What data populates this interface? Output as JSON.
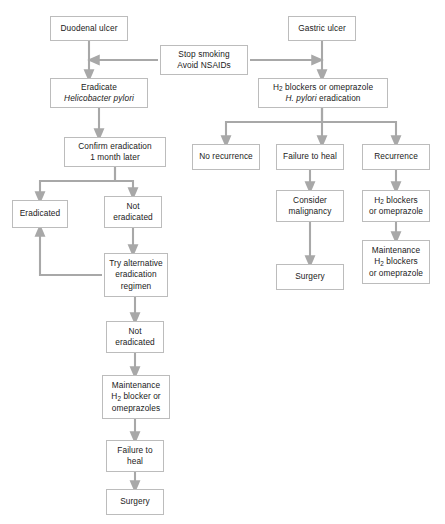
{
  "diagram": {
    "colors": {
      "box_border": "#bcbcbc",
      "box_fill": "#ffffff",
      "arrow": "#a8a8a8",
      "text": "#1a1a1a",
      "background": "#ffffff"
    },
    "nodes": [
      {
        "id": "duodenal_ulcer",
        "label": "Duodenal ulcer",
        "x": 50,
        "y": 16,
        "w": 78,
        "h": 25
      },
      {
        "id": "gastric_ulcer",
        "label": "Gastric ulcer",
        "x": 288,
        "y": 16,
        "w": 68,
        "h": 25
      },
      {
        "id": "stop_smoking",
        "label": "Stop smoking\nAvoid NSAIDs",
        "x": 160,
        "y": 45,
        "w": 88,
        "h": 30
      },
      {
        "id": "eradicate_hp",
        "label": "Eradicate\nHelicobacter pylori",
        "x": 50,
        "y": 78,
        "w": 98,
        "h": 30
      },
      {
        "id": "h2_blockers_top",
        "label": "H2 blockers or omeprazole\nH. pylori eradication",
        "x": 258,
        "y": 78,
        "w": 130,
        "h": 30
      },
      {
        "id": "confirm_eradication",
        "label": "Confirm eradication\n1 month later",
        "x": 64,
        "y": 137,
        "w": 102,
        "h": 30
      },
      {
        "id": "no_recurrence",
        "label": "No recurrence",
        "x": 192,
        "y": 144,
        "w": 68,
        "h": 26
      },
      {
        "id": "failure_to_heal_r",
        "label": "Failure to heal",
        "x": 276,
        "y": 144,
        "w": 68,
        "h": 26
      },
      {
        "id": "recurrence",
        "label": "Recurrence",
        "x": 362,
        "y": 144,
        "w": 68,
        "h": 26
      },
      {
        "id": "eradicated",
        "label": "Eradicated",
        "x": 12,
        "y": 200,
        "w": 56,
        "h": 28
      },
      {
        "id": "not_eradicated_1",
        "label": "Not\neradicated",
        "x": 104,
        "y": 196,
        "w": 58,
        "h": 32
      },
      {
        "id": "consider_malignancy",
        "label": "Consider\nmalignancy",
        "x": 276,
        "y": 190,
        "w": 68,
        "h": 32
      },
      {
        "id": "h2_blockers_mid",
        "label": "H2 blockers\nor omeprazole",
        "x": 362,
        "y": 190,
        "w": 68,
        "h": 32
      },
      {
        "id": "try_alternative",
        "label": "Try alternative\neradication\nregimen",
        "x": 104,
        "y": 253,
        "w": 64,
        "h": 44
      },
      {
        "id": "maintenance_right",
        "label": "Maintenance\nH2 blockers\nor omeprazole",
        "x": 362,
        "y": 240,
        "w": 68,
        "h": 44
      },
      {
        "id": "surgery_mid",
        "label": "Surgery",
        "x": 276,
        "y": 264,
        "w": 68,
        "h": 26
      },
      {
        "id": "not_eradicated_2",
        "label": "Not\neradicated",
        "x": 106,
        "y": 321,
        "w": 58,
        "h": 32
      },
      {
        "id": "maintenance_left",
        "label": "Maintenance\nH2 blocker or\nomeprazoles",
        "x": 102,
        "y": 375,
        "w": 68,
        "h": 44
      },
      {
        "id": "failure_to_heal_l",
        "label": "Failure to\nheal",
        "x": 106,
        "y": 440,
        "w": 58,
        "h": 32
      },
      {
        "id": "surgery_left",
        "label": "Surgery",
        "x": 106,
        "y": 489,
        "w": 58,
        "h": 26
      }
    ],
    "edges": [
      {
        "from": "duodenal_ulcer",
        "to": "eradicate_hp",
        "kind": "vertical"
      },
      {
        "from": "gastric_ulcer",
        "to": "h2_blockers_top",
        "kind": "vertical"
      },
      {
        "from": "stop_smoking",
        "to": "duodenal_ulcer_stem",
        "kind": "horizontal-left"
      },
      {
        "from": "stop_smoking",
        "to": "gastric_ulcer_stem",
        "kind": "horizontal-right"
      },
      {
        "from": "eradicate_hp",
        "to": "confirm_eradication",
        "kind": "vertical"
      },
      {
        "from": "confirm_eradication",
        "to": "eradicated",
        "kind": "branch-left"
      },
      {
        "from": "confirm_eradication",
        "to": "not_eradicated_1",
        "kind": "branch-right"
      },
      {
        "from": "not_eradicated_1",
        "to": "try_alternative",
        "kind": "vertical"
      },
      {
        "from": "try_alternative",
        "to": "eradicated",
        "kind": "loop-back-left"
      },
      {
        "from": "try_alternative",
        "to": "not_eradicated_2",
        "kind": "vertical"
      },
      {
        "from": "not_eradicated_2",
        "to": "maintenance_left",
        "kind": "vertical"
      },
      {
        "from": "maintenance_left",
        "to": "failure_to_heal_l",
        "kind": "vertical"
      },
      {
        "from": "failure_to_heal_l",
        "to": "surgery_left",
        "kind": "vertical"
      },
      {
        "from": "h2_blockers_top",
        "to": "no_recurrence",
        "kind": "branch-left"
      },
      {
        "from": "h2_blockers_top",
        "to": "failure_to_heal_r",
        "kind": "branch-center"
      },
      {
        "from": "h2_blockers_top",
        "to": "recurrence",
        "kind": "branch-right"
      },
      {
        "from": "failure_to_heal_r",
        "to": "consider_malignancy",
        "kind": "vertical"
      },
      {
        "from": "consider_malignancy",
        "to": "surgery_mid",
        "kind": "vertical"
      },
      {
        "from": "recurrence",
        "to": "h2_blockers_mid",
        "kind": "vertical"
      },
      {
        "from": "h2_blockers_mid",
        "to": "maintenance_right",
        "kind": "vertical"
      }
    ]
  }
}
